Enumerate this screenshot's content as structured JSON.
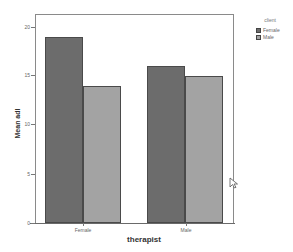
{
  "chart_data": {
    "type": "bar",
    "title": "",
    "xlabel": "therapist",
    "ylabel": "Mean adl",
    "categories": [
      "Female",
      "Male"
    ],
    "series": [
      {
        "name": "Female",
        "color": "#6c6c6c",
        "values": [
          19,
          16
        ]
      },
      {
        "name": "Male",
        "color": "#a3a3a3",
        "values": [
          14,
          15
        ]
      }
    ],
    "ylim": [
      0,
      20
    ],
    "yticks": [
      "0",
      "5",
      "10",
      "15",
      "20"
    ],
    "grid": false,
    "legend": {
      "title": "client",
      "position": "right-top",
      "entries": [
        "Female",
        "Male"
      ]
    }
  }
}
